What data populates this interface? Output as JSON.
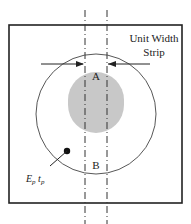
{
  "diagram": {
    "strip_label_line1": "Unit Width",
    "strip_label_line2": "Strip",
    "region_a": "A",
    "region_b": "B",
    "plate_label": "E",
    "plate_label_sub1": "p",
    "plate_label_mid": " t",
    "plate_label_sub2": "p",
    "colors": {
      "line": "#222222",
      "fill_core": "#c8c8c8",
      "background": "#ffffff"
    }
  }
}
